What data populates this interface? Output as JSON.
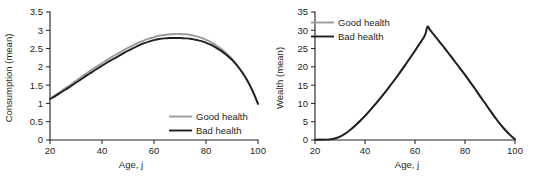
{
  "figure": {
    "background": "#ffffff",
    "good_color": "#9a9a9a",
    "bad_color": "#231f20",
    "axis_color": "#231f20"
  },
  "chart_data": [
    {
      "type": "line",
      "id": "consumption",
      "title": "",
      "xlabel": "Age, j",
      "ylabel": "Consumption (mean)",
      "xlim": [
        20,
        100
      ],
      "ylim": [
        0,
        3.5
      ],
      "xticks": [
        20,
        40,
        60,
        80,
        100
      ],
      "xtick_labels": [
        "20",
        "40",
        "60",
        "80",
        "100"
      ],
      "yticks": [
        0,
        0.5,
        1,
        1.5,
        2,
        2.5,
        3,
        3.5
      ],
      "ytick_labels": [
        "0",
        "0.5",
        "1",
        "1.5",
        "2",
        "2.5",
        "3",
        "3.5"
      ],
      "grid": false,
      "legend_position": "lower right",
      "x": [
        20,
        22,
        24,
        26,
        28,
        30,
        32,
        34,
        36,
        38,
        40,
        42,
        44,
        46,
        48,
        50,
        52,
        54,
        56,
        58,
        60,
        62,
        64,
        66,
        68,
        70,
        72,
        74,
        76,
        78,
        80,
        82,
        84,
        86,
        88,
        90,
        92,
        94,
        96,
        98,
        100
      ],
      "series": [
        {
          "name": "Good health",
          "color": "#9a9a9a",
          "values": [
            1.13,
            1.22,
            1.32,
            1.42,
            1.52,
            1.62,
            1.72,
            1.82,
            1.92,
            2.01,
            2.1,
            2.19,
            2.28,
            2.36,
            2.44,
            2.52,
            2.59,
            2.66,
            2.72,
            2.77,
            2.81,
            2.85,
            2.87,
            2.89,
            2.9,
            2.9,
            2.89,
            2.87,
            2.84,
            2.8,
            2.74,
            2.67,
            2.58,
            2.48,
            2.36,
            2.22,
            2.05,
            1.85,
            1.62,
            1.33,
            0.99
          ]
        },
        {
          "name": "Bad health",
          "color": "#231f20",
          "values": [
            1.12,
            1.2,
            1.29,
            1.38,
            1.47,
            1.57,
            1.66,
            1.76,
            1.85,
            1.94,
            2.03,
            2.12,
            2.2,
            2.28,
            2.36,
            2.44,
            2.51,
            2.58,
            2.64,
            2.69,
            2.73,
            2.76,
            2.78,
            2.79,
            2.79,
            2.79,
            2.78,
            2.77,
            2.74,
            2.71,
            2.66,
            2.6,
            2.52,
            2.43,
            2.32,
            2.19,
            2.03,
            1.84,
            1.61,
            1.33,
            0.99
          ]
        }
      ]
    },
    {
      "type": "line",
      "id": "wealth",
      "title": "",
      "xlabel": "Age, j",
      "ylabel": "Wealth (mean)",
      "xlim": [
        20,
        100
      ],
      "ylim": [
        0,
        35
      ],
      "xticks": [
        20,
        40,
        60,
        80,
        100
      ],
      "xtick_labels": [
        "20",
        "40",
        "60",
        "80",
        "100"
      ],
      "yticks": [
        0,
        5,
        10,
        15,
        20,
        25,
        30,
        35
      ],
      "ytick_labels": [
        "0",
        "5",
        "10",
        "15",
        "20",
        "25",
        "30",
        "35"
      ],
      "grid": false,
      "legend_position": "upper left",
      "x": [
        20,
        22,
        24,
        26,
        28,
        30,
        32,
        34,
        36,
        38,
        40,
        42,
        44,
        46,
        48,
        50,
        52,
        54,
        56,
        58,
        60,
        62,
        64,
        65,
        66,
        68,
        70,
        72,
        74,
        76,
        78,
        80,
        82,
        84,
        86,
        88,
        90,
        92,
        94,
        96,
        98,
        100
      ],
      "series": [
        {
          "name": "Good health",
          "color": "#9a9a9a",
          "values": [
            0.05,
            0.07,
            0.1,
            0.18,
            0.4,
            0.9,
            1.7,
            2.7,
            3.9,
            5.2,
            6.6,
            8.1,
            9.7,
            11.3,
            13.0,
            14.8,
            16.6,
            18.5,
            20.4,
            22.4,
            24.4,
            26.5,
            28.7,
            31.0,
            30.1,
            28.4,
            26.7,
            25.0,
            23.2,
            21.4,
            19.6,
            17.8,
            15.9,
            14.0,
            12.0,
            10.1,
            8.1,
            6.2,
            4.4,
            2.8,
            1.4,
            0.2
          ]
        },
        {
          "name": "Bad health",
          "color": "#231f20",
          "values": [
            0.05,
            0.07,
            0.1,
            0.18,
            0.4,
            0.9,
            1.7,
            2.7,
            3.9,
            5.2,
            6.6,
            8.1,
            9.7,
            11.3,
            13.0,
            14.8,
            16.6,
            18.5,
            20.4,
            22.4,
            24.4,
            26.5,
            28.7,
            31.0,
            30.1,
            28.4,
            26.7,
            25.0,
            23.2,
            21.4,
            19.6,
            17.8,
            15.9,
            14.0,
            12.0,
            10.1,
            8.1,
            6.2,
            4.4,
            2.8,
            1.4,
            0.2
          ]
        }
      ]
    }
  ]
}
